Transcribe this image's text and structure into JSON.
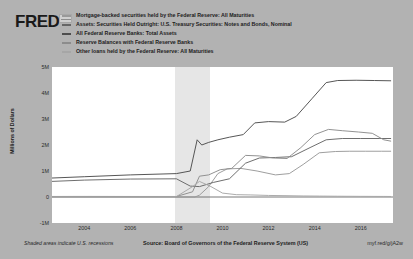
{
  "brand": {
    "logo_text": "FRED",
    "logo_mark": "fred-graph-mark"
  },
  "footer": {
    "recession_note": "Shaded areas indicate U.S. recessions",
    "source": "Source: Board of Governors of the Federal Reserve System (US)",
    "short_url": "myf.red/g/jA2w"
  },
  "chart_data": {
    "type": "line",
    "title": "",
    "xlabel": "",
    "ylabel": "Millions of Dollars",
    "xlim": [
      2002.6,
      2017.4
    ],
    "ylim": [
      -1000000,
      5000000
    ],
    "grid": false,
    "legend_position": "top",
    "x_ticks": [
      "2004",
      "2006",
      "2008",
      "2010",
      "2012",
      "2014",
      "2016"
    ],
    "x_tick_values": [
      2004,
      2006,
      2008,
      2010,
      2012,
      2014,
      2016
    ],
    "y_ticks": [
      "5M",
      "4M",
      "3M",
      "2M",
      "1M",
      "0",
      "-1M"
    ],
    "y_tick_values": [
      5000000,
      4000000,
      3000000,
      2000000,
      1000000,
      0,
      -1000000
    ],
    "shaded_regions": [
      {
        "label": "U.S. recession",
        "x_start": 2007.95,
        "x_end": 2009.45,
        "color": "#e6e6e6"
      }
    ],
    "series": [
      {
        "name": "Mortgage-backed securities held by the Federal Reserve: All Maturities",
        "color": "#999999",
        "x": [
          2002.6,
          2004,
          2006,
          2008,
          2008.8,
          2009.0,
          2009.4,
          2009.8,
          2010.2,
          2010.8,
          2011.5,
          2012.3,
          2012.9,
          2013.5,
          2014.2,
          2014.9,
          2015.5,
          2016.2,
          2016.9,
          2017.3
        ],
        "values": [
          0,
          0,
          0,
          0,
          0,
          70000,
          400000,
          900000,
          1080000,
          1100000,
          1000000,
          850000,
          900000,
          1250000,
          1700000,
          1750000,
          1760000,
          1760000,
          1760000,
          1760000
        ]
      },
      {
        "name": "Assets: Securities Held Outright: U.S. Treasury Securities: Notes and Bonds, Nominal",
        "color": "#666666",
        "x": [
          2002.6,
          2004,
          2006,
          2008,
          2008.6,
          2009.0,
          2009.6,
          2010.3,
          2011.0,
          2011.6,
          2012.3,
          2013.0,
          2013.8,
          2014.5,
          2015.2,
          2016.0,
          2016.8,
          2017.3
        ],
        "values": [
          600000,
          650000,
          690000,
          700000,
          420000,
          400000,
          560000,
          700000,
          1300000,
          1500000,
          1520000,
          1550000,
          1900000,
          2200000,
          2250000,
          2250000,
          2250000,
          2250000
        ]
      },
      {
        "name": "All Federal Reserve Banks: Total Assets",
        "color": "#4d4d4d",
        "x": [
          2002.6,
          2004,
          2006,
          2008,
          2008.6,
          2008.9,
          2009.1,
          2009.4,
          2009.8,
          2010.3,
          2010.9,
          2011.4,
          2012.0,
          2012.7,
          2013.2,
          2013.9,
          2014.5,
          2015.0,
          2015.8,
          2016.6,
          2017.3
        ],
        "values": [
          730000,
          780000,
          850000,
          900000,
          1000000,
          2200000,
          2000000,
          2100000,
          2200000,
          2300000,
          2400000,
          2850000,
          2900000,
          2880000,
          3100000,
          3800000,
          4400000,
          4480000,
          4490000,
          4480000,
          4470000
        ]
      },
      {
        "name": "Reserve Balances with Federal Reserve Banks",
        "color": "#8c8c8c",
        "x": [
          2002.6,
          2004,
          2006,
          2008,
          2008.7,
          2009.0,
          2009.4,
          2009.9,
          2010.4,
          2011.0,
          2011.6,
          2012.2,
          2012.8,
          2013.4,
          2014.0,
          2014.6,
          2015.2,
          2015.9,
          2016.5,
          2017.0,
          2017.3
        ],
        "values": [
          20000,
          22000,
          20000,
          20000,
          200000,
          800000,
          850000,
          1050000,
          1100000,
          1600000,
          1580000,
          1500000,
          1480000,
          1900000,
          2400000,
          2600000,
          2550000,
          2500000,
          2450000,
          2200000,
          2150000
        ]
      },
      {
        "name": "Other loans held by the Federal Reserve: All Maturities",
        "color": "#a6a6a6",
        "x": [
          2002.6,
          2004,
          2006,
          2008,
          2008.7,
          2009.0,
          2009.5,
          2010.0,
          2010.6,
          2011.2,
          2012.0,
          2012.8,
          2013.5,
          2014.2,
          2015.0,
          2016.0,
          2017.0,
          2017.3
        ],
        "values": [
          10000,
          10000,
          10000,
          15000,
          400000,
          600000,
          400000,
          150000,
          90000,
          80000,
          60000,
          50000,
          40000,
          35000,
          30000,
          25000,
          22000,
          20000
        ]
      }
    ]
  }
}
